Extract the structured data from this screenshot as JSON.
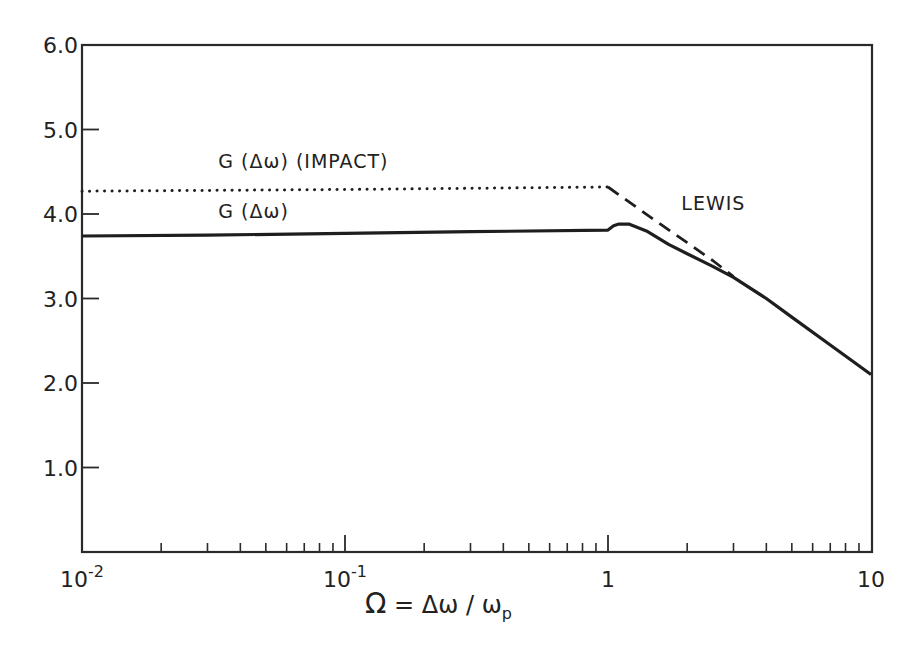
{
  "chart_data": {
    "type": "line",
    "title": "",
    "xlabel": "Ω = Δω / ω_p",
    "xlabel_parts": {
      "omega": "Ω",
      "eq": " = Δω / ω",
      "sub": "p"
    },
    "ylabel": "",
    "xscale": "log",
    "xlim": [
      0.01,
      10
    ],
    "ylim": [
      0,
      6.0
    ],
    "grid": false,
    "legend": "inline annotations",
    "x_ticks": [
      {
        "value": 0.01,
        "label_base": "10",
        "label_exp": "-2"
      },
      {
        "value": 0.1,
        "label_base": "10",
        "label_exp": "-1"
      },
      {
        "value": 1,
        "label_base": "1",
        "label_exp": ""
      },
      {
        "value": 10,
        "label_base": "10",
        "label_exp": ""
      }
    ],
    "y_ticks": [
      {
        "value": 1.0,
        "label": "1.0"
      },
      {
        "value": 2.0,
        "label": "2.0"
      },
      {
        "value": 3.0,
        "label": "3.0"
      },
      {
        "value": 4.0,
        "label": "4.0"
      },
      {
        "value": 5.0,
        "label": "5.0"
      },
      {
        "value": 6.0,
        "label": "6.0"
      }
    ],
    "series": [
      {
        "name": "G (Δω)",
        "style": "solid",
        "x": [
          0.01,
          0.03,
          0.1,
          0.3,
          1.0,
          1.05,
          1.1,
          1.2,
          1.4,
          1.7,
          2.0,
          2.5,
          3.0,
          4.0,
          5.0,
          7.0,
          10.0
        ],
        "values": [
          3.74,
          3.75,
          3.77,
          3.79,
          3.81,
          3.86,
          3.88,
          3.88,
          3.8,
          3.64,
          3.53,
          3.38,
          3.25,
          3.0,
          2.78,
          2.45,
          2.1
        ]
      },
      {
        "name": "G (Δω) (IMPACT)",
        "style": "dotted",
        "x": [
          0.01,
          0.1,
          1.0
        ],
        "values": [
          4.27,
          4.29,
          4.32
        ]
      },
      {
        "name": "LEWIS",
        "style": "dashed",
        "x": [
          1.0,
          1.5,
          2.0,
          2.5,
          3.0
        ],
        "values": [
          4.32,
          3.93,
          3.66,
          3.45,
          3.26
        ]
      }
    ],
    "annotations": [
      {
        "text": "G (Δω) (IMPACT)",
        "x": 0.033,
        "y": 4.55
      },
      {
        "text": "G (Δω)",
        "x": 0.033,
        "y": 3.95
      },
      {
        "text": "LEWIS",
        "x": 1.9,
        "y": 4.05
      }
    ]
  }
}
